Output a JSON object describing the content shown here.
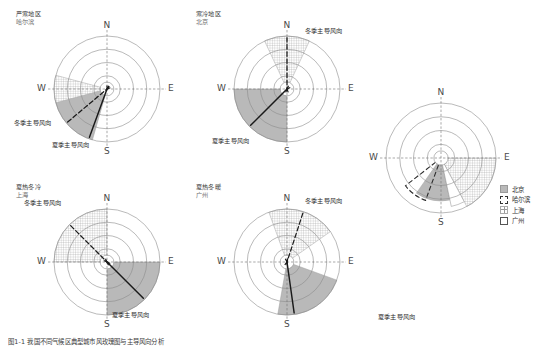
{
  "figure": {
    "caption": "图1-1  我国不同气候区典型城市风玫瑰图与主导风向分析",
    "background": "#ffffff"
  },
  "colors": {
    "summer_fill": "#b9b9b9",
    "winter_hatch": "#9a9a9a",
    "circle_stroke": "#8c8c8c",
    "axis_stroke": "#6f6f6f",
    "arrow_summer": "#1a1a1a",
    "arrow_winter": "#1a1a1a",
    "text": "#333333",
    "city_text": "#6d6d6d"
  },
  "cardinals": {
    "n": "N",
    "e": "E",
    "s": "S",
    "w": "W"
  },
  "labels": {
    "winter": "冬季主导风向",
    "summer": "夏季主导风向"
  },
  "roses": [
    {
      "id": "harbin",
      "zone": "严寒地区",
      "city": "哈尔滨",
      "center": [
        107,
        89
      ],
      "radius": 53,
      "rings": 4,
      "summer_sector": {
        "start_deg": 196,
        "end_deg": 262,
        "radius_ratio": 1.0,
        "label": "夏季主导风向"
      },
      "winter_sector": {
        "start_deg": 255,
        "end_deg": 285,
        "radius_ratio": 1.0,
        "label": "冬季主导风向"
      },
      "summer_arrow_deg": 200,
      "winter_arrow_deg": 230,
      "winter_label_pos": [
        14,
        118
      ],
      "summer_label_pos": [
        52,
        140
      ]
    },
    {
      "id": "beijing",
      "zone": "寒冷地区",
      "city": "北京",
      "center": [
        287,
        89
      ],
      "radius": 53,
      "rings": 4,
      "summer_sector": {
        "start_deg": 180,
        "end_deg": 270,
        "radius_ratio": 1.0,
        "label": "夏季主导风向"
      },
      "winter_sector": {
        "start_deg": 335,
        "end_deg": 25,
        "radius_ratio": 1.0,
        "label": "冬季主导风向"
      },
      "summer_arrow_deg": 225,
      "winter_arrow_deg": 0,
      "winter_label_pos": [
        305,
        26
      ],
      "summer_label_pos": [
        212,
        136
      ]
    },
    {
      "id": "shanghai",
      "zone": "夏热冬冷",
      "city": "上海",
      "center": [
        107,
        262
      ],
      "radius": 53,
      "rings": 4,
      "summer_sector": {
        "start_deg": 90,
        "end_deg": 180,
        "radius_ratio": 1.0,
        "label": "夏季主导风向"
      },
      "winter_sector": {
        "start_deg": 270,
        "end_deg": 360,
        "radius_ratio": 1.0,
        "label": "冬季主导风向"
      },
      "summer_arrow_deg": 135,
      "winter_arrow_deg": 315,
      "winter_label_pos": [
        24,
        198
      ],
      "summer_label_pos": [
        112,
        310
      ]
    },
    {
      "id": "guangzhou",
      "zone": "夏热冬暖",
      "city": "广州",
      "center": [
        287,
        262
      ],
      "radius": 53,
      "rings": 4,
      "summer_sector": {
        "start_deg": 110,
        "end_deg": 190,
        "radius_ratio": 1.0,
        "label": "夏季主导风向"
      },
      "winter_sector": {
        "start_deg": 340,
        "end_deg": 55,
        "radius_ratio": 1.0,
        "label": "冬季主导风向"
      },
      "summer_arrow_deg": 172,
      "winter_arrow_deg": 18,
      "winter_label_pos": [
        305,
        196
      ],
      "summer_label_pos": [
        378,
        312
      ]
    }
  ],
  "combined": {
    "id": "combined-rose",
    "center": [
      441,
      158
    ],
    "radius": 55,
    "rings": 4,
    "sectors": [
      {
        "city": "北京",
        "style": "solid",
        "start_deg": 168,
        "end_deg": 215,
        "radius_ratio": 0.78
      },
      {
        "city": "哈尔滨",
        "style": "dashed",
        "start_deg": 200,
        "end_deg": 232,
        "radius_ratio": 0.82
      },
      {
        "city": "上海",
        "style": "hatch",
        "start_deg": 90,
        "end_deg": 152,
        "radius_ratio": 1.0
      },
      {
        "city": "广州",
        "style": "white",
        "start_deg": 152,
        "end_deg": 168,
        "radius_ratio": 0.9
      }
    ]
  },
  "legend": {
    "position": [
      500,
      184
    ],
    "items": [
      {
        "label": "北京",
        "style": "solid"
      },
      {
        "label": "哈尔滨",
        "style": "dashed"
      },
      {
        "label": "上海",
        "style": "hatch"
      },
      {
        "label": "广州",
        "style": "white"
      }
    ]
  }
}
